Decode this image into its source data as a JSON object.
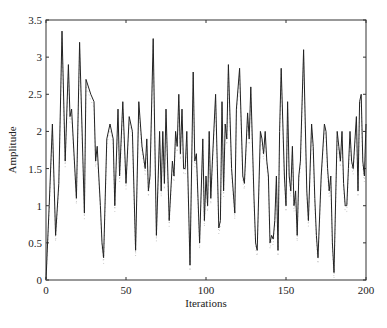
{
  "chart_data": {
    "type": "line",
    "title": "",
    "xlabel": "Iterations",
    "ylabel": "Amplitude",
    "xlim": [
      0,
      200
    ],
    "ylim": [
      0,
      3.5
    ],
    "xticks": [
      0,
      50,
      100,
      150,
      200
    ],
    "yticks": [
      0,
      0.5,
      1,
      1.5,
      2,
      2.5,
      3,
      3.5
    ],
    "xtick_labels": [
      "0",
      "50",
      "100",
      "150",
      "200"
    ],
    "ytick_labels": [
      "0",
      "0.5",
      "1",
      "1.5",
      "2",
      "2.5",
      "3",
      "3.5"
    ],
    "grid": false,
    "legend": null,
    "series": [
      {
        "name": "amplitude",
        "color": "#222222",
        "x": [
          0,
          2,
          4,
          6,
          8,
          10,
          12,
          14,
          15,
          16,
          19,
          21,
          24,
          25,
          28,
          30,
          31,
          32,
          34,
          35,
          36,
          38,
          40,
          42,
          43,
          45,
          46,
          48,
          50,
          52,
          54,
          56,
          58,
          60,
          62,
          63,
          64,
          65,
          67,
          69,
          71,
          72,
          73,
          74,
          75,
          77,
          79,
          80,
          81,
          82,
          83,
          84,
          85,
          86,
          87,
          88,
          90,
          92,
          93,
          94,
          95,
          96,
          98,
          99,
          100,
          101,
          102,
          103,
          104,
          106,
          108,
          109,
          110,
          111,
          112,
          113,
          114,
          116,
          117,
          118,
          119,
          121,
          123,
          124,
          126,
          127,
          128,
          130,
          131,
          132,
          134,
          135,
          136,
          137,
          138,
          139,
          140,
          141,
          142,
          143,
          144,
          145,
          146,
          147,
          149,
          150,
          151,
          152,
          153,
          154,
          155,
          156,
          157,
          158,
          159,
          161,
          163,
          164,
          166,
          167,
          168,
          169,
          170,
          172,
          174,
          175,
          176,
          177,
          178,
          179,
          180,
          182,
          183,
          184,
          185,
          186,
          187,
          188,
          189,
          190,
          191,
          192,
          194,
          195,
          196,
          197,
          198,
          199,
          200
        ],
        "y": [
          0,
          1.0,
          2.1,
          0.6,
          1.3,
          3.35,
          1.6,
          2.9,
          2.2,
          2.3,
          1.1,
          3.2,
          0.9,
          2.7,
          2.5,
          2.4,
          1.6,
          1.8,
          1.0,
          0.5,
          0.3,
          1.9,
          2.1,
          1.9,
          1.0,
          2.3,
          1.4,
          2.4,
          1.3,
          2.2,
          2.0,
          0.4,
          2.4,
          1.8,
          1.5,
          1.9,
          1.2,
          1.4,
          3.25,
          0.6,
          2.0,
          1.2,
          2.0,
          1.3,
          2.3,
          0.8,
          1.6,
          1.4,
          2.0,
          1.8,
          2.5,
          1.7,
          2.3,
          1.5,
          1.5,
          2.0,
          0.2,
          2.8,
          1.6,
          1.7,
          1.1,
          0.5,
          1.9,
          0.8,
          1.4,
          1.0,
          2.0,
          1.1,
          1.6,
          2.5,
          0.7,
          0.8,
          2.4,
          1.2,
          2.1,
          1.9,
          2.9,
          1.5,
          1.2,
          0.9,
          2.3,
          2.85,
          1.4,
          1.3,
          2.25,
          1.9,
          2.6,
          1.1,
          0.5,
          0.4,
          2.0,
          1.9,
          1.7,
          2.0,
          1.6,
          1.4,
          0.5,
          0.6,
          0.55,
          0.8,
          1.4,
          0.4,
          2.0,
          2.85,
          1.4,
          1.0,
          2.4,
          1.4,
          1.2,
          1.8,
          1.0,
          1.2,
          0.6,
          1.4,
          1.6,
          3.1,
          1.2,
          0.8,
          2.1,
          1.8,
          1.1,
          0.6,
          0.3,
          1.4,
          2.1,
          2.0,
          1.5,
          1.2,
          1.4,
          0.5,
          0.1,
          2.0,
          1.8,
          1.6,
          2.0,
          1.3,
          1.0,
          1.0,
          1.5,
          2.0,
          1.6,
          1.5,
          2.2,
          1.2,
          2.4,
          2.5,
          1.6,
          1.4,
          2.1
        ]
      }
    ]
  }
}
